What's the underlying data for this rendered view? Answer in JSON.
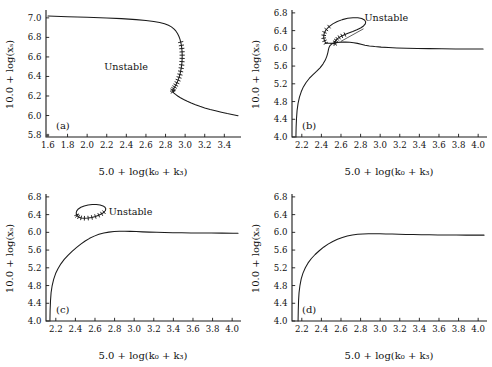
{
  "figure": {
    "background": "#ffffff",
    "curve_color": "#1a1a1a",
    "axis_color": "#1a1a1a"
  },
  "axis_titles": {
    "x": "5.0 + log(k₀ + k₃)",
    "y": "10.0 + log(xₛ)"
  },
  "annotations": {
    "unstable": "Unstable"
  },
  "panels": [
    {
      "id": "a",
      "label": "(a)",
      "xlim": [
        1.58,
        3.56
      ],
      "ylim": [
        5.78,
        7.06
      ],
      "xticks": [
        1.6,
        1.8,
        2.0,
        2.2,
        2.4,
        2.6,
        2.8,
        3.0,
        3.2,
        3.4
      ],
      "yticks": [
        5.8,
        6.0,
        6.2,
        6.4,
        6.6,
        6.8,
        7.0
      ],
      "xticklabels": [
        "1.6",
        "1.8",
        "2.0",
        "2.2",
        "2.4",
        "2.6",
        "2.8",
        "3.0",
        "3.2",
        "3.4"
      ],
      "yticklabels": [
        "5.8",
        "6.0",
        "6.2",
        "6.4",
        "6.6",
        "6.8",
        "7.0"
      ],
      "has_unstable_label": true,
      "unstable_label_at": [
        2.62,
        6.47
      ],
      "shape": "s-curve-fold",
      "curve": [
        [
          1.6,
          7.018
        ],
        [
          1.8,
          7.012
        ],
        [
          2.0,
          7.006
        ],
        [
          2.2,
          6.999
        ],
        [
          2.35,
          6.992
        ],
        [
          2.5,
          6.982
        ],
        [
          2.6,
          6.973
        ],
        [
          2.68,
          6.963
        ],
        [
          2.74,
          6.952
        ],
        [
          2.79,
          6.939
        ],
        [
          2.83,
          6.924
        ],
        [
          2.86,
          6.908
        ],
        [
          2.885,
          6.888
        ],
        [
          2.905,
          6.866
        ],
        [
          2.922,
          6.84
        ],
        [
          2.936,
          6.812
        ],
        [
          2.947,
          6.782
        ],
        [
          2.955,
          6.752
        ],
        [
          2.962,
          6.718
        ],
        [
          2.966,
          6.686
        ],
        [
          2.969,
          6.652
        ],
        [
          2.97,
          6.618
        ],
        [
          2.9695,
          6.585
        ],
        [
          2.968,
          6.552
        ],
        [
          2.965,
          6.518
        ],
        [
          2.96,
          6.485
        ],
        [
          2.954,
          6.452
        ],
        [
          2.947,
          6.42
        ],
        [
          2.938,
          6.39
        ],
        [
          2.928,
          6.362
        ],
        [
          2.917,
          6.336
        ],
        [
          2.905,
          6.312
        ],
        [
          2.893,
          6.292
        ],
        [
          2.882,
          6.275
        ],
        [
          2.874,
          6.262
        ],
        [
          2.872,
          6.252
        ],
        [
          2.876,
          6.242
        ],
        [
          2.886,
          6.23
        ],
        [
          2.902,
          6.216
        ],
        [
          2.924,
          6.2
        ],
        [
          2.952,
          6.182
        ],
        [
          2.985,
          6.164
        ],
        [
          3.022,
          6.146
        ],
        [
          3.062,
          6.128
        ],
        [
          3.105,
          6.11
        ],
        [
          3.15,
          6.094
        ],
        [
          3.2,
          6.078
        ],
        [
          3.255,
          6.062
        ],
        [
          3.31,
          6.048
        ],
        [
          3.37,
          6.034
        ],
        [
          3.43,
          6.02
        ],
        [
          3.49,
          6.008
        ],
        [
          3.54,
          5.998
        ]
      ],
      "hatched_segment": {
        "from_index": 17,
        "to_index": 36,
        "side": "left"
      }
    },
    {
      "id": "b",
      "label": "(b)",
      "xlim": [
        2.1,
        4.08
      ],
      "ylim": [
        4.0,
        6.82
      ],
      "xticks": [
        2.2,
        2.4,
        2.6,
        2.8,
        3.0,
        3.2,
        3.4,
        3.6,
        3.8,
        4.0
      ],
      "yticks": [
        4.0,
        4.4,
        4.8,
        5.2,
        5.6,
        6.0,
        6.4,
        6.8
      ],
      "xticklabels": [
        "2.2",
        "2.4",
        "2.6",
        "2.8",
        "3.0",
        "3.2",
        "3.4",
        "3.6",
        "3.8",
        "4.0"
      ],
      "yticklabels": [
        "4.0",
        "4.4",
        "4.8",
        "5.2",
        "5.6",
        "6.0",
        "6.4",
        "6.8"
      ],
      "has_unstable_label": true,
      "unstable_label_at": [
        2.84,
        6.62
      ],
      "shape": "mushroom",
      "curve": [
        [
          2.14,
          4.0
        ],
        [
          2.142,
          4.22
        ],
        [
          2.146,
          4.42
        ],
        [
          2.152,
          4.6
        ],
        [
          2.162,
          4.76
        ],
        [
          2.176,
          4.9
        ],
        [
          2.194,
          5.02
        ],
        [
          2.216,
          5.13
        ],
        [
          2.244,
          5.23
        ],
        [
          2.276,
          5.32
        ],
        [
          2.312,
          5.4
        ],
        [
          2.35,
          5.48
        ],
        [
          2.386,
          5.56
        ],
        [
          2.416,
          5.645
        ],
        [
          2.44,
          5.735
        ],
        [
          2.456,
          5.825
        ],
        [
          2.466,
          5.905
        ],
        [
          2.472,
          5.97
        ],
        [
          2.478,
          6.02
        ],
        [
          2.488,
          6.062
        ],
        [
          2.504,
          6.095
        ],
        [
          2.528,
          6.118
        ],
        [
          2.56,
          6.132
        ],
        [
          2.6,
          6.14
        ],
        [
          2.645,
          6.142
        ],
        [
          2.69,
          6.138
        ],
        [
          2.73,
          6.128
        ],
        [
          2.768,
          6.112
        ],
        [
          2.805,
          6.092
        ],
        [
          2.845,
          6.072
        ],
        [
          2.89,
          6.055
        ],
        [
          2.945,
          6.04
        ],
        [
          3.01,
          6.028
        ],
        [
          3.085,
          6.018
        ],
        [
          3.17,
          6.01
        ],
        [
          3.27,
          6.003
        ],
        [
          3.38,
          5.998
        ],
        [
          3.5,
          5.994
        ],
        [
          3.63,
          5.99
        ],
        [
          3.77,
          5.987
        ],
        [
          3.91,
          5.985
        ],
        [
          4.05,
          5.983
        ]
      ],
      "loop": [
        [
          2.445,
          6.115
        ],
        [
          2.432,
          6.17
        ],
        [
          2.424,
          6.23
        ],
        [
          2.424,
          6.295
        ],
        [
          2.432,
          6.36
        ],
        [
          2.45,
          6.425
        ],
        [
          2.478,
          6.49
        ],
        [
          2.516,
          6.552
        ],
        [
          2.562,
          6.605
        ],
        [
          2.614,
          6.648
        ],
        [
          2.668,
          6.678
        ],
        [
          2.722,
          6.692
        ],
        [
          2.772,
          6.69
        ],
        [
          2.812,
          6.672
        ],
        [
          2.84,
          6.64
        ],
        [
          2.852,
          6.598
        ],
        [
          2.848,
          6.552
        ],
        [
          2.83,
          6.505
        ],
        [
          2.8,
          6.46
        ],
        [
          2.762,
          6.418
        ],
        [
          2.72,
          6.38
        ],
        [
          2.678,
          6.345
        ],
        [
          2.64,
          6.312
        ],
        [
          2.608,
          6.28
        ],
        [
          2.582,
          6.248
        ],
        [
          2.562,
          6.215
        ],
        [
          2.548,
          6.182
        ],
        [
          2.54,
          6.15
        ],
        [
          2.538,
          6.122
        ],
        [
          2.542,
          6.1
        ],
        [
          2.532,
          6.108
        ],
        [
          2.51,
          6.112
        ],
        [
          2.484,
          6.114
        ],
        [
          2.462,
          6.115
        ],
        [
          2.445,
          6.115
        ]
      ],
      "loop_hatched_ranges": [
        [
          0,
          6
        ],
        [
          22,
          30
        ]
      ]
    },
    {
      "id": "c",
      "label": "(c)",
      "xlim": [
        2.1,
        4.08
      ],
      "ylim": [
        4.0,
        6.82
      ],
      "xticks": [
        2.2,
        2.4,
        2.6,
        2.8,
        3.0,
        3.2,
        3.4,
        3.6,
        3.8,
        4.0
      ],
      "yticks": [
        4.0,
        4.4,
        4.8,
        5.2,
        5.6,
        6.0,
        6.4,
        6.8
      ],
      "xticklabels": [
        "2.2",
        "2.4",
        "2.6",
        "2.8",
        "3.0",
        "3.2",
        "3.4",
        "3.6",
        "3.8",
        "4.0"
      ],
      "yticklabels": [
        "4.0",
        "4.4",
        "4.8",
        "5.2",
        "5.6",
        "6.0",
        "6.4",
        "6.8"
      ],
      "has_unstable_label": true,
      "unstable_label_at": [
        2.74,
        6.4
      ],
      "shape": "isola-plus-monotone",
      "curve": [
        [
          2.14,
          4.0
        ],
        [
          2.142,
          4.24
        ],
        [
          2.146,
          4.46
        ],
        [
          2.152,
          4.64
        ],
        [
          2.163,
          4.8
        ],
        [
          2.178,
          4.94
        ],
        [
          2.198,
          5.07
        ],
        [
          2.222,
          5.18
        ],
        [
          2.252,
          5.29
        ],
        [
          2.286,
          5.39
        ],
        [
          2.324,
          5.48
        ],
        [
          2.366,
          5.57
        ],
        [
          2.41,
          5.655
        ],
        [
          2.455,
          5.735
        ],
        [
          2.5,
          5.805
        ],
        [
          2.545,
          5.865
        ],
        [
          2.592,
          5.915
        ],
        [
          2.64,
          5.955
        ],
        [
          2.69,
          5.985
        ],
        [
          2.742,
          6.005
        ],
        [
          2.795,
          6.018
        ],
        [
          2.85,
          6.024
        ],
        [
          2.905,
          6.025
        ],
        [
          2.96,
          6.022
        ],
        [
          3.02,
          6.017
        ],
        [
          3.085,
          6.011
        ],
        [
          3.155,
          6.005
        ],
        [
          3.23,
          6.0
        ],
        [
          3.31,
          5.996
        ],
        [
          3.395,
          5.992
        ],
        [
          3.485,
          5.989
        ],
        [
          3.58,
          5.987
        ],
        [
          3.68,
          5.985
        ],
        [
          3.785,
          5.984
        ],
        [
          3.895,
          5.983
        ],
        [
          4.01,
          5.982
        ],
        [
          4.06,
          5.982
        ]
      ],
      "isola": [
        [
          2.412,
          6.395
        ],
        [
          2.408,
          6.44
        ],
        [
          2.414,
          6.485
        ],
        [
          2.43,
          6.528
        ],
        [
          2.456,
          6.565
        ],
        [
          2.49,
          6.596
        ],
        [
          2.53,
          6.618
        ],
        [
          2.572,
          6.63
        ],
        [
          2.614,
          6.63
        ],
        [
          2.652,
          6.618
        ],
        [
          2.682,
          6.596
        ],
        [
          2.702,
          6.566
        ],
        [
          2.71,
          6.53
        ],
        [
          2.706,
          6.492
        ],
        [
          2.692,
          6.454
        ],
        [
          2.668,
          6.418
        ],
        [
          2.638,
          6.386
        ],
        [
          2.604,
          6.358
        ],
        [
          2.568,
          6.336
        ],
        [
          2.53,
          6.322
        ],
        [
          2.492,
          6.318
        ],
        [
          2.458,
          6.326
        ],
        [
          2.432,
          6.348
        ],
        [
          2.416,
          6.372
        ],
        [
          2.412,
          6.395
        ]
      ],
      "isola_hatched_ranges": [
        [
          14,
          24
        ]
      ]
    },
    {
      "id": "d",
      "label": "(d)",
      "xlim": [
        2.1,
        4.08
      ],
      "ylim": [
        4.0,
        6.82
      ],
      "xticks": [
        2.2,
        2.4,
        2.6,
        2.8,
        3.0,
        3.2,
        3.4,
        3.6,
        3.8,
        4.0
      ],
      "yticks": [
        4.0,
        4.4,
        4.8,
        5.2,
        5.6,
        6.0,
        6.4,
        6.8
      ],
      "xticklabels": [
        "2.2",
        "2.4",
        "2.6",
        "2.8",
        "3.0",
        "3.2",
        "3.4",
        "3.6",
        "3.8",
        "4.0"
      ],
      "yticklabels": [
        "4.0",
        "4.4",
        "4.8",
        "5.2",
        "5.6",
        "6.0",
        "6.4",
        "6.8"
      ],
      "has_unstable_label": false,
      "shape": "monotone-saturating",
      "curve": [
        [
          2.162,
          4.0
        ],
        [
          2.164,
          4.24
        ],
        [
          2.167,
          4.46
        ],
        [
          2.172,
          4.64
        ],
        [
          2.181,
          4.8
        ],
        [
          2.194,
          4.95
        ],
        [
          2.212,
          5.08
        ],
        [
          2.236,
          5.2
        ],
        [
          2.264,
          5.31
        ],
        [
          2.298,
          5.41
        ],
        [
          2.336,
          5.5
        ],
        [
          2.378,
          5.585
        ],
        [
          2.422,
          5.665
        ],
        [
          2.468,
          5.735
        ],
        [
          2.516,
          5.795
        ],
        [
          2.564,
          5.845
        ],
        [
          2.614,
          5.885
        ],
        [
          2.664,
          5.917
        ],
        [
          2.716,
          5.94
        ],
        [
          2.77,
          5.955
        ],
        [
          2.824,
          5.965
        ],
        [
          2.88,
          5.969
        ],
        [
          2.938,
          5.97
        ],
        [
          2.996,
          5.968
        ],
        [
          3.058,
          5.965
        ],
        [
          3.122,
          5.961
        ],
        [
          3.19,
          5.957
        ],
        [
          3.262,
          5.953
        ],
        [
          3.338,
          5.95
        ],
        [
          3.418,
          5.947
        ],
        [
          3.502,
          5.944
        ],
        [
          3.59,
          5.942
        ],
        [
          3.682,
          5.94
        ],
        [
          3.778,
          5.939
        ],
        [
          3.878,
          5.938
        ],
        [
          3.982,
          5.937
        ],
        [
          4.06,
          5.937
        ]
      ]
    }
  ]
}
